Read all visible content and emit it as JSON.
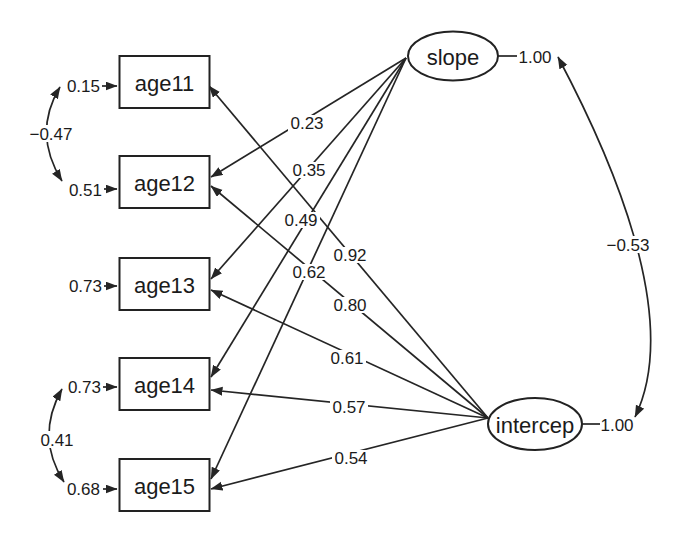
{
  "colors": {
    "ink": "#1b1b1b",
    "background": "#ffffff"
  },
  "nodes": {
    "age11": {
      "label": "age11",
      "error": "0.15"
    },
    "age12": {
      "label": "age12",
      "error": "0.51"
    },
    "age13": {
      "label": "age13",
      "error": "0.73"
    },
    "age14": {
      "label": "age14",
      "error": "0.73"
    },
    "age15": {
      "label": "age15",
      "error": "0.68"
    },
    "slope": {
      "label": "slope",
      "variance": "1.00"
    },
    "intercep": {
      "label": "intercep",
      "variance": "1.00"
    }
  },
  "loadings": {
    "slope_age12": "0.23",
    "slope_age13": "0.35",
    "slope_age14": "0.49",
    "slope_age15": "0.62",
    "intercep_age11": "0.92",
    "intercep_age12": "0.80",
    "intercep_age13": "0.61",
    "intercep_age14": "0.57",
    "intercep_age15": "0.54"
  },
  "covariances": {
    "err_age11_age12": "−0.47",
    "err_age14_age15": "0.41",
    "slope_intercep": "−0.53"
  }
}
